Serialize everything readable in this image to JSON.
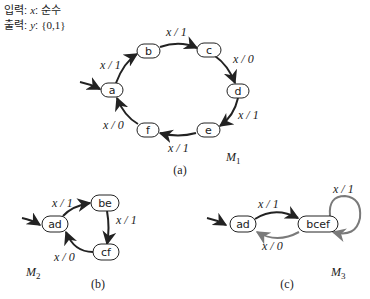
{
  "legend": {
    "input_label": "입력",
    "input_var": "x",
    "input_value": "순수",
    "output_label": "출력",
    "output_var": "y",
    "output_value": "{0,1}"
  },
  "diagrams": [
    {
      "id": "a",
      "caption": "(a)",
      "machine": "M",
      "machine_sub": "1",
      "states": [
        "a",
        "b",
        "c",
        "d",
        "e",
        "f"
      ],
      "initial": "a",
      "transitions": [
        {
          "from": "a",
          "to": "b",
          "label": "x / 1"
        },
        {
          "from": "b",
          "to": "c",
          "label": "x / 1"
        },
        {
          "from": "c",
          "to": "d",
          "label": "x / 0"
        },
        {
          "from": "d",
          "to": "e",
          "label": "x / 1"
        },
        {
          "from": "e",
          "to": "f",
          "label": "x / 1"
        },
        {
          "from": "f",
          "to": "a",
          "label": "x / 0"
        }
      ]
    },
    {
      "id": "b",
      "caption": "(b)",
      "machine": "M",
      "machine_sub": "2",
      "states": [
        "ad",
        "be",
        "cf"
      ],
      "initial": "ad",
      "transitions": [
        {
          "from": "ad",
          "to": "be",
          "label": "x / 1"
        },
        {
          "from": "be",
          "to": "cf",
          "label": "x / 1"
        },
        {
          "from": "cf",
          "to": "ad",
          "label": "x / 0"
        }
      ]
    },
    {
      "id": "c",
      "caption": "(c)",
      "machine": "M",
      "machine_sub": "3",
      "states": [
        "ad",
        "bcef"
      ],
      "initial": "ad",
      "transitions": [
        {
          "from": "ad",
          "to": "bcef",
          "label": "x / 1"
        },
        {
          "from": "bcef",
          "to": "ad",
          "label": "x / 0"
        },
        {
          "from": "bcef",
          "to": "bcef",
          "label": "x / 1"
        }
      ]
    }
  ],
  "colors": {
    "stroke": "#222222",
    "gray_edge": "#7a7a7a"
  }
}
